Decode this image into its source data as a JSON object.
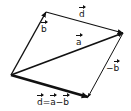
{
  "diagram": {
    "colors": {
      "stroke": "#111111",
      "background": "#ffffff"
    },
    "points": {
      "O": [
        11,
        75
      ],
      "B": [
        46,
        12
      ],
      "A": [
        123,
        33
      ],
      "D": [
        88,
        97
      ]
    },
    "vectors": [
      {
        "id": "b",
        "from": "O",
        "to": "B",
        "label": "b",
        "width": 1.4
      },
      {
        "id": "d_top",
        "from": "B",
        "to": "A",
        "label": "d",
        "width": 1.2
      },
      {
        "id": "a",
        "from": "O",
        "to": "A",
        "label": "a",
        "width": 1.8
      },
      {
        "id": "neg_b",
        "from": "A",
        "to": "D",
        "label": "−b",
        "width": 1.0
      },
      {
        "id": "d",
        "from": "O",
        "to": "D",
        "label": "d = a − b",
        "width": 2.6
      }
    ],
    "labels": {
      "b": "b",
      "d_top": "d",
      "a": "a",
      "neg_b_sign": "−",
      "neg_b": "b",
      "eq_d": "d",
      "eq_sign": "=",
      "eq_a": "a",
      "eq_minus": "−",
      "eq_b": "b"
    }
  }
}
